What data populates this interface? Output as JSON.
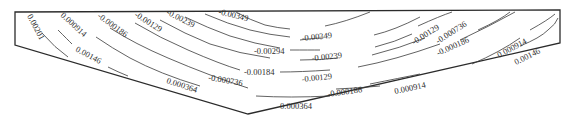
{
  "figure": {
    "type": "contour-diagram"
  },
  "contour_levels": [
    {
      "id": "l1",
      "label": "0.00201"
    },
    {
      "id": "l2",
      "label": "0.00146"
    },
    {
      "id": "l3",
      "label": "0.000914"
    },
    {
      "id": "l4",
      "label": "0.000364"
    },
    {
      "id": "l5",
      "label": "-0.000186"
    },
    {
      "id": "l6",
      "label": "-0.000736"
    },
    {
      "id": "l7",
      "label": "-0.00129"
    },
    {
      "id": "l8",
      "label": "-0.00184"
    },
    {
      "id": "l9",
      "label": "-0.00239"
    },
    {
      "id": "l10",
      "label": "-0.00294"
    },
    {
      "id": "l11",
      "label": "-0.00349"
    }
  ],
  "labels": [
    {
      "text": "0.00201"
    },
    {
      "text": "0.000914"
    },
    {
      "text": "-0.000186"
    },
    {
      "text": "-0.00129"
    },
    {
      "text": "-0.00239"
    },
    {
      "text": "-0.00349"
    },
    {
      "text": "0.00146"
    },
    {
      "text": "-0.00294"
    },
    {
      "text": "-0.00184"
    },
    {
      "text": "-0.000736"
    },
    {
      "text": "0.000364"
    },
    {
      "text": "-0.00349"
    },
    {
      "text": "-0.00239"
    },
    {
      "text": "-0.00129"
    },
    {
      "text": "-0.000186"
    },
    {
      "text": "0.000364"
    },
    {
      "text": "0.000914"
    },
    {
      "text": "-0.00129"
    },
    {
      "text": "-0.000736"
    },
    {
      "text": "-0.000186"
    },
    {
      "text": "0.000914"
    },
    {
      "text": "0.00146"
    }
  ]
}
